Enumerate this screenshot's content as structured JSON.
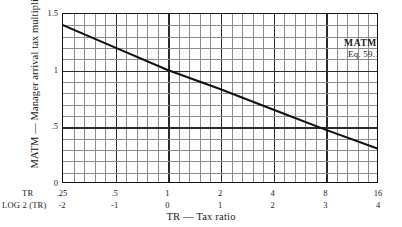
{
  "chart_data": {
    "type": "line",
    "title": "",
    "annotation": {
      "name": "MATMT",
      "equation": "Eq. 59.1"
    },
    "xlabel": "TR — Tax ratio",
    "ylabel": "MATM — Manager arrival tax multiplier",
    "x_scale": "log2",
    "xlim": [
      0.25,
      16
    ],
    "ylim": [
      0,
      1.5
    ],
    "grid": true,
    "legend": "none",
    "x_axis_rows": [
      {
        "key": "TR",
        "ticks": [
          ".25",
          ".5",
          "1",
          "2",
          "4",
          "8",
          "16"
        ]
      },
      {
        "key": "LOG 2 (TR)",
        "ticks": [
          "-2",
          "-1",
          "0",
          "1",
          "2",
          "3",
          "4"
        ]
      }
    ],
    "x_tick_values": [
      0.25,
      0.5,
      1,
      2,
      4,
      8,
      16
    ],
    "x_tick_log2": [
      -2,
      -1,
      0,
      1,
      2,
      3,
      4
    ],
    "y_tick_labels": [
      "1.5",
      "1",
      ".5",
      "0"
    ],
    "y_tick_values": [
      1.5,
      1.0,
      0.5,
      0
    ],
    "minor_divisions_x": 5,
    "minor_divisions_y": 5,
    "series": [
      {
        "name": "MATMT",
        "x": [
          0.25,
          0.5,
          1,
          2,
          4,
          8,
          16
        ],
        "x_log2": [
          -2,
          -1,
          0,
          1,
          2,
          3,
          4
        ],
        "values": [
          1.4,
          1.2,
          1.0,
          0.83,
          0.65,
          0.47,
          0.3
        ],
        "color": "#111111",
        "line_width": 2.1
      }
    ]
  },
  "labels": {
    "y_axis_title": "MATM — Manager arrival tax multiplier",
    "x_axis_title": "TR — Tax ratio",
    "annotation_title": "MATMT",
    "annotation_sub": "Eq. 59.1",
    "tr_row_key": "TR",
    "log_row_key": "LOG 2 (TR)"
  },
  "colors": {
    "line": "#111111",
    "frame": "#111111",
    "grid_minor": "#8c8c8c",
    "grid_major": "#2a2a2a",
    "background": "#ffffff",
    "text": "#1a1a1a"
  }
}
